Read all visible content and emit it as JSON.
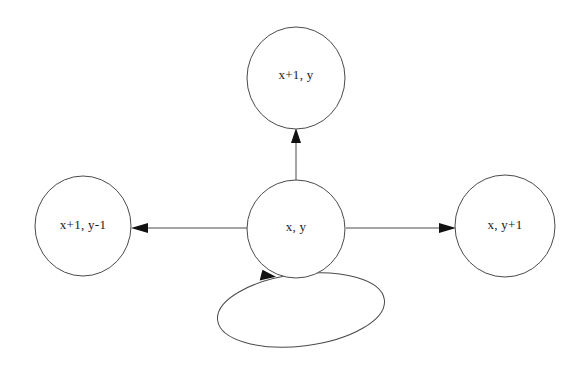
{
  "diagram": {
    "background_color": "#ffffff",
    "node_stroke_color": "#4a4a4a",
    "arrow_color": "#111111",
    "label_color": "#1a1a1a",
    "nodes": [
      {
        "id": "top",
        "label": "x+1, y",
        "cx": 296,
        "cy": 78,
        "rx": 49,
        "ry": 51
      },
      {
        "id": "center",
        "label": "x, y",
        "cx": 296,
        "cy": 229,
        "rx": 49,
        "ry": 49
      },
      {
        "id": "left",
        "label": "x+1, y-1",
        "cx": 83,
        "cy": 226,
        "rx": 48,
        "ry": 50
      },
      {
        "id": "right",
        "label": "x, y+1",
        "cx": 505,
        "cy": 226,
        "rx": 50,
        "ry": 51
      }
    ],
    "edges": [
      {
        "id": "center-to-top",
        "from": "center",
        "to": "top",
        "direction": "up"
      },
      {
        "id": "center-to-left",
        "from": "center",
        "to": "left",
        "direction": "left"
      },
      {
        "id": "center-to-right",
        "from": "center",
        "to": "right",
        "direction": "right"
      },
      {
        "id": "center-self-loop",
        "from": "center",
        "to": "center",
        "direction": "self-loop"
      }
    ]
  }
}
